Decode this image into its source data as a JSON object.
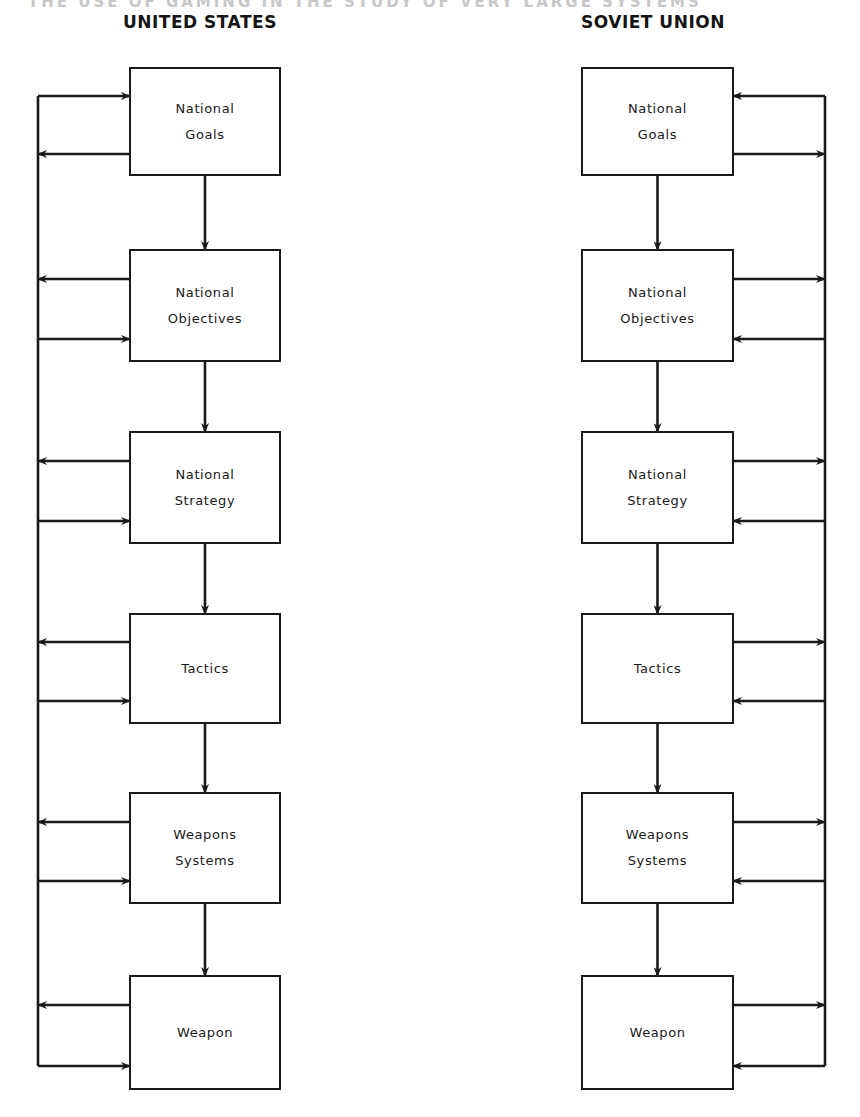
{
  "page": {
    "running_header": "THE USE OF GAMING IN THE STUDY OF VERY LARGE SYSTEMS"
  },
  "diagram": {
    "columns": [
      {
        "id": "us",
        "title": "UNITED STATES",
        "feedback_bus_side": "left",
        "boxes": [
          {
            "line1": "National",
            "line2": "Goals",
            "top_arrow": "into-box",
            "bottom_arrow": "to-bus"
          },
          {
            "line1": "National",
            "line2": "Objectives",
            "top_arrow": "to-bus",
            "bottom_arrow": "into-box"
          },
          {
            "line1": "National",
            "line2": "Strategy",
            "top_arrow": "to-bus",
            "bottom_arrow": "into-box"
          },
          {
            "line1": "Tactics",
            "line2": "",
            "top_arrow": "to-bus",
            "bottom_arrow": "into-box"
          },
          {
            "line1": "Weapons",
            "line2": "Systems",
            "top_arrow": "to-bus",
            "bottom_arrow": "into-box"
          },
          {
            "line1": "Weapon",
            "line2": "",
            "top_arrow": "to-bus",
            "bottom_arrow": "into-box"
          }
        ]
      },
      {
        "id": "su",
        "title": "SOVIET UNION",
        "feedback_bus_side": "right",
        "boxes": [
          {
            "line1": "National",
            "line2": "Goals",
            "top_arrow": "into-box",
            "bottom_arrow": "to-bus"
          },
          {
            "line1": "National",
            "line2": "Objectives",
            "top_arrow": "to-bus",
            "bottom_arrow": "into-box"
          },
          {
            "line1": "National",
            "line2": "Strategy",
            "top_arrow": "to-bus",
            "bottom_arrow": "into-box"
          },
          {
            "line1": "Tactics",
            "line2": "",
            "top_arrow": "to-bus",
            "bottom_arrow": "into-box"
          },
          {
            "line1": "Weapons",
            "line2": "Systems",
            "top_arrow": "to-bus",
            "bottom_arrow": "into-box"
          },
          {
            "line1": "Weapon",
            "line2": "",
            "top_arrow": "to-bus",
            "bottom_arrow": "into-box"
          }
        ]
      }
    ],
    "colors": {
      "ink": "#1a1a1a",
      "background": "#ffffff"
    }
  }
}
